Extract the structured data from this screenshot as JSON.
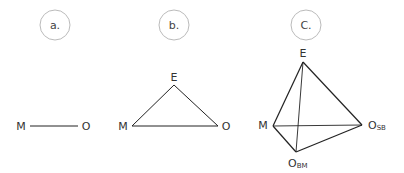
{
  "panels": [
    {
      "label": "a.",
      "nodes": {
        "M": "M",
        "O": "O"
      }
    },
    {
      "label": "b.",
      "nodes": {
        "E": "E",
        "M": "M",
        "O": "O"
      }
    },
    {
      "label": "C.",
      "nodes": {
        "E": "E",
        "M": "M",
        "OSB_main": "O",
        "OSB_sub": "SB",
        "OBM_main": "O",
        "OBM_sub": "BM"
      }
    }
  ],
  "colors": {
    "line": "#222222",
    "circle": "#bbbbbb",
    "text": "#333333"
  }
}
